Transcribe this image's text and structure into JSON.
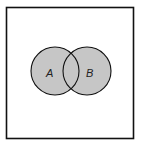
{
  "diagram": {
    "type": "venn",
    "universe": {
      "x": 6,
      "y": 7,
      "width": 127,
      "height": 131,
      "stroke": "#111111"
    },
    "sets": [
      {
        "label": "A",
        "cx": 55,
        "cy": 71,
        "r": 24,
        "fill": "#c6c6c6"
      },
      {
        "label": "B",
        "cx": 87,
        "cy": 71,
        "r": 24,
        "fill": "#c6c6c6"
      }
    ],
    "stroke": "#111111"
  }
}
